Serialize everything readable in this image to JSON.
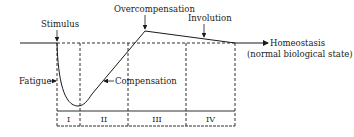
{
  "diagram": {
    "labels": {
      "stimulus": "Stimulus",
      "overcompensation": "Overcompensation",
      "involution": "Involution",
      "homeostasis": "Homeostasis",
      "homeostasis_sub": "(normal biological state)",
      "fatigue": "Fatigue",
      "compensation": "Compensation"
    },
    "phases": [
      {
        "label": "I"
      },
      {
        "label": "II"
      },
      {
        "label": "III"
      },
      {
        "label": "IV"
      }
    ],
    "colors": {
      "line": "#1a1a1a",
      "background": "#ffffff"
    }
  }
}
